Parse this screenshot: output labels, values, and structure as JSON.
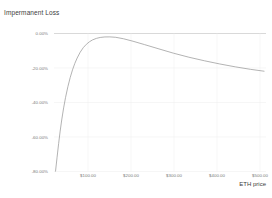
{
  "chart_data": {
    "type": "line",
    "title": "Impermanent Loss",
    "xlabel": "ETH price",
    "ylabel": "",
    "grid": true,
    "legend_position": "none",
    "xlim": [
      10,
      560
    ],
    "ylim": [
      -80,
      2
    ],
    "x_ticks": [
      100,
      200,
      300,
      400,
      500
    ],
    "x_tick_labels": [
      "$100.00",
      "$200.00",
      "$300.00",
      "$400.00",
      "$500.00"
    ],
    "y_ticks": [
      0,
      -20,
      -40,
      -60,
      -80
    ],
    "y_tick_labels": [
      "0.00%",
      "-20.00%",
      "-40.00%",
      "-60.00%",
      "-80.00%"
    ],
    "series": [
      {
        "name": "Impermanent Loss",
        "color": "#9a9a9a",
        "x": [
          14,
          18,
          22,
          26,
          30,
          35,
          40,
          46,
          52,
          58,
          64,
          70,
          78,
          86,
          94,
          102,
          110,
          120,
          130,
          142,
          155,
          170,
          190,
          215,
          245,
          280,
          320,
          360,
          400,
          440,
          480,
          520,
          555
        ],
        "values": [
          -79.8,
          -71.5,
          -63.4,
          -56.0,
          -49.4,
          -42.2,
          -36.0,
          -29.6,
          -24.2,
          -19.6,
          -15.8,
          -12.6,
          -9.1,
          -6.4,
          -4.4,
          -2.9,
          -1.8,
          -0.9,
          -0.35,
          -0.05,
          -0.02,
          -0.25,
          -1.1,
          -2.6,
          -4.6,
          -7.0,
          -9.7,
          -12.1,
          -14.2,
          -16.1,
          -17.8,
          -19.3,
          -20.4
        ]
      }
    ],
    "annotations": []
  },
  "colors": {
    "axis": "#c8c8c8",
    "grid": "#ededed",
    "line": "#9a9a9a",
    "tick_text": "#7a7a7a",
    "title_text": "#3c3c3c"
  }
}
